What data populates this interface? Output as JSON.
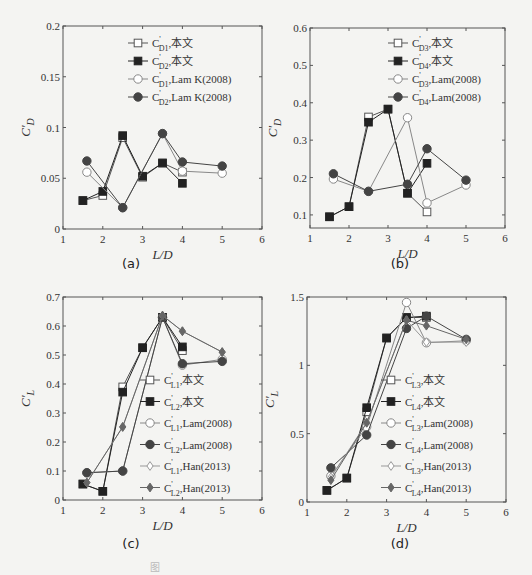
{
  "figure_caption": "图",
  "chart_data": [
    {
      "id": "a",
      "panel_label": "(a)",
      "type": "line",
      "xlabel": "L/D",
      "ylabel": "C'_D",
      "xlim": [
        1,
        6
      ],
      "ylim": [
        0,
        0.2
      ],
      "xticks": [
        1,
        2,
        3,
        4,
        5,
        6
      ],
      "yticks": [
        0,
        0.05,
        0.1,
        0.15,
        0.2
      ],
      "ytick_labels": [
        "0",
        "0.05",
        "0.1",
        "0.15",
        "0.2"
      ],
      "legend_position": "top-right",
      "series": [
        {
          "name": "C'D1,本文",
          "sub": "D1",
          "suffix": ",本文",
          "marker": "square-open",
          "color": "#555555",
          "x": [
            1.5,
            2,
            2.5,
            3,
            3.5,
            4
          ],
          "y": [
            0.028,
            0.033,
            0.09,
            0.051,
            0.065,
            0.056
          ]
        },
        {
          "name": "C'D2,本文",
          "sub": "D2",
          "suffix": ",本文",
          "marker": "square-filled",
          "color": "#222222",
          "x": [
            1.5,
            2,
            2.5,
            3,
            3.5,
            4
          ],
          "y": [
            0.028,
            0.037,
            0.092,
            0.052,
            0.065,
            0.045
          ]
        },
        {
          "name": "C'D1,Lam K(2008)",
          "sub": "D1",
          "suffix": ",Lam K(2008)",
          "marker": "circle-open",
          "color": "#888888",
          "x": [
            1.6,
            2.5,
            3.5,
            4,
            5
          ],
          "y": [
            0.056,
            0.021,
            0.094,
            0.057,
            0.055
          ]
        },
        {
          "name": "C'D2,Lam K(2008)",
          "sub": "D2",
          "suffix": ",Lam K(2008)",
          "marker": "circle-filled",
          "color": "#444444",
          "x": [
            1.6,
            2.5,
            3.5,
            4,
            5
          ],
          "y": [
            0.067,
            0.021,
            0.094,
            0.066,
            0.062
          ]
        }
      ]
    },
    {
      "id": "b",
      "panel_label": "(b)",
      "type": "line",
      "xlabel": "L/D",
      "ylabel": "C'_D",
      "xlim": [
        1,
        6
      ],
      "ylim": [
        0.065,
        0.6
      ],
      "xticks": [
        1,
        2,
        3,
        4,
        5,
        6
      ],
      "yticks": [
        0.1,
        0.2,
        0.3,
        0.4,
        0.5,
        0.6
      ],
      "ytick_labels": [
        "0.1",
        "0.2",
        "0.3",
        "0.4",
        "0.5",
        "0.6"
      ],
      "legend_position": "top-right",
      "series": [
        {
          "name": "C'D3,本文",
          "sub": "D3",
          "suffix": ",本文",
          "marker": "square-open",
          "color": "#555555",
          "x": [
            1.5,
            2,
            2.5,
            3,
            3.5,
            4
          ],
          "y": [
            0.095,
            0.122,
            0.362,
            0.383,
            0.158,
            0.108
          ]
        },
        {
          "name": "C'D4,本文",
          "sub": "D4",
          "suffix": ",本文",
          "marker": "square-filled",
          "color": "#222222",
          "x": [
            1.5,
            2,
            2.5,
            3,
            3.5,
            4
          ],
          "y": [
            0.095,
            0.122,
            0.348,
            0.383,
            0.158,
            0.238
          ]
        },
        {
          "name": "C'D3,Lam(2008)",
          "sub": "D3",
          "suffix": ",Lam(2008)",
          "marker": "circle-open",
          "color": "#888888",
          "x": [
            1.6,
            2.5,
            3.5,
            4,
            5
          ],
          "y": [
            0.196,
            0.163,
            0.36,
            0.132,
            0.18
          ]
        },
        {
          "name": "C'D4,Lam(2008)",
          "sub": "D4",
          "suffix": ",Lam(2008)",
          "marker": "circle-filled",
          "color": "#444444",
          "x": [
            1.6,
            2.5,
            3.5,
            4,
            5
          ],
          "y": [
            0.21,
            0.163,
            0.182,
            0.277,
            0.193
          ]
        }
      ]
    },
    {
      "id": "c",
      "panel_label": "(c)",
      "type": "line",
      "xlabel": "L/D",
      "ylabel": "C'_L",
      "xlim": [
        1,
        6
      ],
      "ylim": [
        0,
        0.7
      ],
      "xticks": [
        1,
        2,
        3,
        4,
        5,
        6
      ],
      "yticks": [
        0,
        0.1,
        0.2,
        0.3,
        0.4,
        0.5,
        0.6,
        0.7
      ],
      "ytick_labels": [
        "0",
        "0.1",
        "0.2",
        "0.3",
        "0.4",
        "0.5",
        "0.6",
        "0.7"
      ],
      "legend_position": "center-right",
      "series": [
        {
          "name": "C'L1,本文",
          "sub": "L1",
          "suffix": ",本文",
          "marker": "square-open",
          "color": "#555555",
          "x": [
            1.5,
            2,
            2.5,
            3,
            3.5,
            4
          ],
          "y": [
            0.055,
            0.03,
            0.39,
            0.525,
            0.63,
            0.515
          ]
        },
        {
          "name": "C'L2,本文",
          "sub": "L2",
          "suffix": ",本文",
          "marker": "square-filled",
          "color": "#222222",
          "x": [
            1.5,
            2,
            2.5,
            3,
            3.5,
            4
          ],
          "y": [
            0.055,
            0.03,
            0.372,
            0.525,
            0.63,
            0.528
          ]
        },
        {
          "name": "C'L1,Lam(2008)",
          "sub": "L1",
          "suffix": ",Lam(2008)",
          "marker": "circle-open",
          "color": "#888888",
          "x": [
            1.6,
            2.5,
            3.5,
            4,
            5
          ],
          "y": [
            0.094,
            0.1,
            0.63,
            0.465,
            0.485
          ]
        },
        {
          "name": "C'L2,Lam(2008)",
          "sub": "L2",
          "suffix": ",Lam(2008)",
          "marker": "circle-filled",
          "color": "#444444",
          "x": [
            1.6,
            2.5,
            3.5,
            4,
            5
          ],
          "y": [
            0.094,
            0.1,
            0.63,
            0.47,
            0.478
          ]
        },
        {
          "name": "C'L1,Han(2013)",
          "sub": "L1",
          "suffix": ",Han(2013)",
          "marker": "diamond-open",
          "color": "#999999",
          "x": [
            1.6,
            2.5,
            3.5,
            4,
            5
          ],
          "y": [
            0.06,
            0.252,
            0.636,
            0.582,
            0.51
          ]
        },
        {
          "name": "C'L2,Han(2013)",
          "sub": "L2",
          "suffix": ",Han(2013)",
          "marker": "diamond-filled",
          "color": "#666666",
          "x": [
            1.6,
            2.5,
            3.5,
            4,
            5
          ],
          "y": [
            0.06,
            0.252,
            0.636,
            0.582,
            0.51
          ]
        }
      ]
    },
    {
      "id": "d",
      "panel_label": "(d)",
      "type": "line",
      "xlabel": "L/D",
      "ylabel": "C'_L",
      "xlim": [
        1,
        6
      ],
      "ylim": [
        0,
        1.5
      ],
      "xticks": [
        1,
        2,
        3,
        4,
        5,
        6
      ],
      "yticks": [
        0,
        0.5,
        1,
        1.5
      ],
      "ytick_labels": [
        "0",
        "0.5",
        "1",
        "1.5"
      ],
      "legend_position": "center-right",
      "series": [
        {
          "name": "C'L3,本文",
          "sub": "L3",
          "suffix": ",本文",
          "marker": "square-open",
          "color": "#555555",
          "x": [
            1.5,
            2,
            2.5,
            3,
            3.5,
            4
          ],
          "y": [
            0.085,
            0.175,
            0.66,
            1.2,
            1.35,
            1.35
          ]
        },
        {
          "name": "C'L4,本文",
          "sub": "L4",
          "suffix": ",本文",
          "marker": "square-filled",
          "color": "#222222",
          "x": [
            1.5,
            2,
            2.5,
            3,
            3.5,
            4
          ],
          "y": [
            0.085,
            0.175,
            0.69,
            1.2,
            1.35,
            1.36
          ]
        },
        {
          "name": "C'L3,Lam(2008)",
          "sub": "L3",
          "suffix": ",Lam(2008)",
          "marker": "circle-open",
          "color": "#888888",
          "x": [
            1.6,
            2.5,
            3.5,
            4,
            5
          ],
          "y": [
            0.19,
            0.55,
            1.46,
            1.165,
            1.18
          ]
        },
        {
          "name": "C'L4,Lam(2008)",
          "sub": "L4",
          "suffix": ",Lam(2008)",
          "marker": "circle-filled",
          "color": "#444444",
          "x": [
            1.6,
            2.5,
            3.5,
            4,
            5
          ],
          "y": [
            0.25,
            0.49,
            1.27,
            1.36,
            1.19
          ]
        },
        {
          "name": "C'L3,Han(2013)",
          "sub": "L3",
          "suffix": ",Han(2013)",
          "marker": "diamond-open",
          "color": "#999999",
          "x": [
            1.6,
            2.5,
            3.5,
            4,
            5
          ],
          "y": [
            0.18,
            0.58,
            1.33,
            1.17,
            1.17
          ]
        },
        {
          "name": "C'L4,Han(2013)",
          "sub": "L4",
          "suffix": ",Han(2013)",
          "marker": "diamond-filled",
          "color": "#666666",
          "x": [
            1.6,
            2.5,
            3.5,
            4,
            5
          ],
          "y": [
            0.16,
            0.58,
            1.33,
            1.29,
            1.19
          ]
        }
      ]
    }
  ]
}
